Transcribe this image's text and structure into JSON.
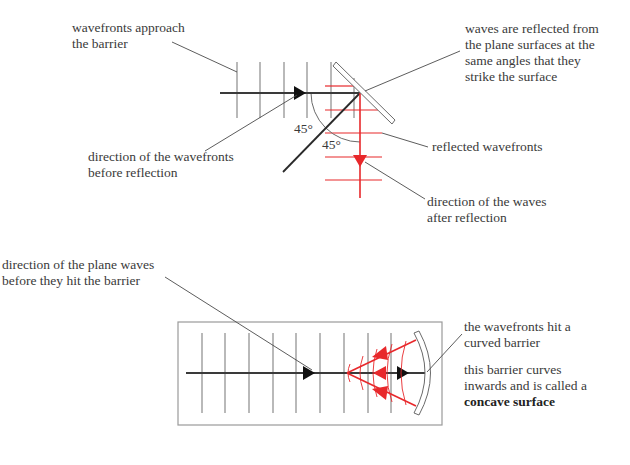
{
  "colors": {
    "ink": "#3a3a3a",
    "grey_line": "#8a8a8a",
    "red": "#e8282b",
    "box": "#9a9a9a"
  },
  "top_diagram": {
    "labels": {
      "wavefronts_approach": [
        "wavefronts approach",
        "the barrier"
      ],
      "direction_before": [
        "direction of the wavefronts",
        "before reflection"
      ],
      "reflected_same_angles": [
        "waves are reflected from",
        "the plane surfaces at the",
        "same angles that they",
        "strike the surface"
      ],
      "reflected_wavefronts": "reflected wavefronts",
      "direction_after": [
        "direction of the waves",
        "after reflection"
      ]
    },
    "angle_incidence": "45°",
    "angle_reflection": "45°"
  },
  "bottom_diagram": {
    "labels": {
      "direction_plane_waves": [
        "direction of the plane waves",
        "before they hit the barrier"
      ],
      "hit_curved_barrier": [
        "the wavefronts hit a",
        "curved barrier"
      ],
      "concave_description": [
        "this barrier curves",
        "inwards and is called a"
      ],
      "concave_term": "concave surface"
    }
  }
}
